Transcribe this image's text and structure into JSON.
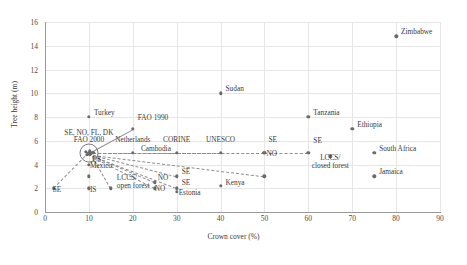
{
  "chart_data": {
    "type": "scatter",
    "title": "",
    "xlabel": "Crown cover (%)",
    "ylabel": "Tree height (m)",
    "xlim": [
      0,
      90
    ],
    "ylim": [
      0,
      16
    ],
    "xticks": [
      0,
      10,
      20,
      30,
      40,
      50,
      60,
      70,
      80,
      90
    ],
    "yticks": [
      0,
      2,
      4,
      6,
      8,
      10,
      12,
      14,
      16
    ],
    "grid": true,
    "legend": "none",
    "points": [
      {
        "label": "Zimbabwe",
        "x": 80,
        "y": 14.8,
        "lx": 5,
        "ly": -4
      },
      {
        "label": "Sudan",
        "x": 40,
        "y": 10.0,
        "lx": 5,
        "ly": -4
      },
      {
        "label": "Tanzania",
        "x": 60,
        "y": 8.0,
        "lx": 5,
        "ly": -4
      },
      {
        "label": "Ethiopia",
        "x": 70,
        "y": 7.0,
        "lx": 5,
        "ly": -4
      },
      {
        "label": "Turkey",
        "x": 10,
        "y": 8.0,
        "lx": 5,
        "ly": -4
      },
      {
        "label": "FAO 1990",
        "x": 20,
        "y": 7.0,
        "lx": 5,
        "ly": -11
      },
      {
        "label": "Netherlands",
        "x": 20,
        "y": 5.0,
        "lx": 0,
        "ly": -13,
        "center": true
      },
      {
        "label": "CORINE",
        "x": 30,
        "y": 5.0,
        "lx": 0,
        "ly": -13,
        "center": true
      },
      {
        "label": "UNESCO",
        "x": 40,
        "y": 5.0,
        "lx": 0,
        "ly": -13,
        "center": true
      },
      {
        "label": "SE",
        "x": 50,
        "y": 5.0,
        "lx": 4,
        "ly": -13
      },
      {
        "label": "NO",
        "x": 50,
        "y": 5.0,
        "lx": 2,
        "ly": 1
      },
      {
        "label": "SE",
        "x": 60,
        "y": 5.0,
        "lx": 5,
        "ly": -12
      },
      {
        "label": "South Africa",
        "x": 75,
        "y": 5.0,
        "lx": 5,
        "ly": -4
      },
      {
        "label": "LCCS/",
        "x": 65,
        "y": 4.7,
        "lx": 0,
        "ly": 2,
        "center": true,
        "sub": "closed forest"
      },
      {
        "label": "Jamaica",
        "x": 75,
        "y": 3.0,
        "lx": 5,
        "ly": -4
      },
      {
        "label": "Kenya",
        "x": 40,
        "y": 2.2,
        "lx": 5,
        "ly": -3
      },
      {
        "label": "SE",
        "x": 30,
        "y": 3.0,
        "lx": 5,
        "ly": -4
      },
      {
        "label": "SE",
        "x": 30,
        "y": 2.0,
        "lx": 5,
        "ly": -5
      },
      {
        "label": "Estonia",
        "x": 30,
        "y": 1.7,
        "lx": 2,
        "ly": 1
      },
      {
        "label": "NO",
        "x": 25,
        "y": 2.5,
        "lx": 3,
        "ly": -4
      },
      {
        "label": "NO",
        "x": 25,
        "y": 2.0,
        "lx": 0,
        "ly": 1
      },
      {
        "label": "US",
        "x": 10,
        "y": 4.0,
        "lx": 3,
        "ly": -5
      },
      {
        "label": "Mexico",
        "x": 10,
        "y": 3.0,
        "lx": 1,
        "ly": -10
      },
      {
        "label": "SE",
        "x": 2,
        "y": 2.0,
        "lx": -1,
        "ly": 2
      },
      {
        "label": "IS",
        "x": 10,
        "y": 2.0,
        "lx": 1,
        "ly": 2
      },
      {
        "label": "LCCS/",
        "x": 15,
        "y": 2.0,
        "lx": 6,
        "ly": -10,
        "sub": "open forest"
      },
      {
        "label": "Cambodia",
        "x": 10,
        "y": 5.0,
        "lx": 52,
        "ly": -4
      },
      {
        "label": "",
        "x": 50,
        "y": 3.0
      },
      {
        "label": "",
        "x": 11,
        "y": 5.0
      }
    ],
    "cluster": {
      "label_line1": "SE, NO, FL, DK",
      "label_line2": "FAO 2000",
      "x": 10,
      "y": 5.0
    },
    "connectors": [
      {
        "x1": 10,
        "y1": 5.0,
        "x2": 20,
        "y2": 7.0,
        "style": "solid"
      },
      {
        "x1": 10,
        "y1": 5.0,
        "x2": 2,
        "y2": 2.0,
        "style": "dashed"
      },
      {
        "x1": 11,
        "y1": 5.0,
        "x2": 20,
        "y2": 5.0,
        "style": "dashed"
      },
      {
        "x1": 11,
        "y1": 5.0,
        "x2": 30,
        "y2": 5.0,
        "style": "dashed"
      },
      {
        "x1": 11,
        "y1": 5.0,
        "x2": 40,
        "y2": 5.0,
        "style": "dashed"
      },
      {
        "x1": 11,
        "y1": 5.0,
        "x2": 50,
        "y2": 5.0,
        "style": "dashed"
      },
      {
        "x1": 50,
        "y1": 5.0,
        "x2": 60,
        "y2": 5.0,
        "style": "dashed"
      },
      {
        "x1": 11,
        "y1": 4.8,
        "x2": 50,
        "y2": 3.0,
        "style": "dashed"
      },
      {
        "x1": 11,
        "y1": 4.8,
        "x2": 30,
        "y2": 3.0,
        "style": "dashed"
      },
      {
        "x1": 11,
        "y1": 4.7,
        "x2": 30,
        "y2": 2.0,
        "style": "dashed"
      },
      {
        "x1": 11,
        "y1": 4.7,
        "x2": 25,
        "y2": 2.5,
        "style": "dashed"
      },
      {
        "x1": 11,
        "y1": 4.6,
        "x2": 25,
        "y2": 2.0,
        "style": "dashed"
      },
      {
        "x1": 11,
        "y1": 4.6,
        "x2": 15,
        "y2": 2.0,
        "style": "dashed"
      }
    ]
  }
}
